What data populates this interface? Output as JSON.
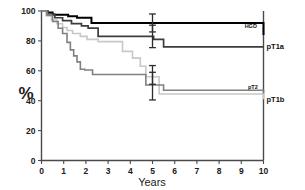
{
  "figure": {
    "y_axis_title": "%",
    "x_axis_title": "Years",
    "y_ticks": [
      "0",
      "20",
      "40",
      "60",
      "80",
      "100"
    ],
    "x_ticks": [
      "0",
      "1",
      "2",
      "3",
      "4",
      "5",
      "6",
      "7",
      "8",
      "9",
      "10"
    ],
    "labels": {
      "hgd": "HGD",
      "pt1a": "pT1a",
      "pt2": "pT2",
      "pt1b": "pT1b"
    },
    "colors": {
      "hgd": "#000000",
      "pt1a": "#3d3d3d",
      "pt2": "#808080",
      "pt1b": "#c8c8c8",
      "axis": "#4a4a4a",
      "text": "#1a1a1a",
      "background": "#ffffff"
    }
  },
  "chart_data": {
    "type": "line",
    "title": "",
    "subtitle": "",
    "xlabel": "Years",
    "ylabel": "%",
    "xlim": [
      0,
      10
    ],
    "ylim": [
      0,
      100
    ],
    "grid": false,
    "legend_position": "inline-right",
    "step": "post",
    "x_ticks": [
      0,
      1,
      2,
      3,
      4,
      5,
      6,
      7,
      8,
      9,
      10
    ],
    "y_ticks": [
      0,
      20,
      40,
      60,
      80,
      100
    ],
    "series": [
      {
        "name": "HGD",
        "color": "#000000",
        "label_x": 9.15,
        "label_y": 89.5,
        "label_placement": "inside",
        "x": [
          0,
          0.25,
          0.5,
          1.2,
          1.6,
          2.25,
          7.45,
          10
        ],
        "y": [
          100,
          99,
          97.5,
          96.5,
          95.5,
          92,
          92,
          84
        ]
      },
      {
        "name": "pT1a",
        "color": "#3d3d3d",
        "label_x": 10.25,
        "label_y": 76,
        "label_placement": "outside-right",
        "x": [
          0,
          0.3,
          0.6,
          0.95,
          1.35,
          1.8,
          2.1,
          2.55,
          4.5,
          5.05,
          5.5,
          10
        ],
        "y": [
          100,
          98,
          95.5,
          93.5,
          91.5,
          90,
          88.5,
          83,
          83,
          81,
          76,
          76
        ]
      },
      {
        "name": "pT1b",
        "color": "#c8c8c8",
        "label_x": 10.25,
        "label_y": 41,
        "label_placement": "outside-right",
        "x": [
          0,
          0.2,
          0.45,
          0.7,
          0.95,
          1.15,
          1.4,
          1.75,
          2.05,
          2.55,
          3.35,
          3.65,
          4.1,
          4.45,
          4.7,
          5.3,
          7.45,
          10
        ],
        "y": [
          100,
          97,
          94,
          91.5,
          89,
          87,
          85,
          83,
          81,
          79.5,
          79.5,
          73,
          68.5,
          63,
          56,
          44.5,
          44.5,
          41
        ]
      },
      {
        "name": "pT2",
        "color": "#808080",
        "label_x": 9.3,
        "label_y": 48.5,
        "label_placement": "inside",
        "x": [
          0,
          0.25,
          0.5,
          0.75,
          0.95,
          1.15,
          1.3,
          1.45,
          1.6,
          1.75,
          1.95,
          2.3,
          4.45,
          4.7,
          5.5,
          7.45,
          10
        ],
        "y": [
          100,
          97,
          93,
          88.5,
          85,
          79,
          74,
          70,
          66,
          61,
          60.5,
          57.5,
          57.5,
          50.5,
          47,
          47,
          45
        ]
      }
    ],
    "error_bars": [
      {
        "series": "HGD",
        "x": 5,
        "y": 92,
        "low": 86,
        "high": 98,
        "color": "#2b2b2b"
      },
      {
        "series": "pT1a",
        "x": 5,
        "y": 83,
        "low": 75.5,
        "high": 90.5,
        "color": "#2b2b2b"
      },
      {
        "series": "pT1b",
        "x": 5,
        "y": 56,
        "low": 51,
        "high": 63.5,
        "color": "#2b2b2b"
      },
      {
        "series": "pT2",
        "x": 5,
        "y": 50.5,
        "low": 40.5,
        "high": 59,
        "color": "#2b2b2b"
      }
    ],
    "annotations": [
      {
        "text": "HGD",
        "x": 9.15,
        "y": 89.5
      },
      {
        "text": "pT1a",
        "x": 10.25,
        "y": 76
      },
      {
        "text": "pT2",
        "x": 9.3,
        "y": 48.5
      },
      {
        "text": "pT1b",
        "x": 10.25,
        "y": 41
      }
    ]
  }
}
